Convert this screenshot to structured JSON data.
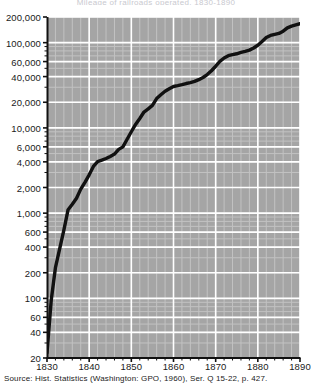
{
  "figure": {
    "title_cropped": "Mileage of railroads operated, 1830-1890",
    "source_note": "Source: Hist. Statistics (Washington: GPO, 1960), Ser. Q 15-22, p. 427.",
    "colors": {
      "plot_background": "#a5a5a5",
      "gridline": "#ffffff",
      "minor_gridline": "#c2c2c2",
      "curve": "#111111",
      "axis": "#111111",
      "page_background": "#ffffff",
      "text": "#1a1a1a"
    }
  },
  "chart_data": {
    "type": "line",
    "title": "Mileage of railroads operated, 1830-1890",
    "xlabel": "",
    "ylabel": "",
    "yscale": "log",
    "xscale": "linear",
    "grid": true,
    "legend": null,
    "xlim": [
      1830,
      1890
    ],
    "ylim": [
      20,
      200000
    ],
    "xticks": [
      1830,
      1840,
      1850,
      1860,
      1870,
      1880,
      1890
    ],
    "xticklabels": [
      "1830",
      "1840",
      "1850",
      "1860",
      "1870",
      "1880",
      "1890"
    ],
    "yticks": [
      20,
      40,
      60,
      100,
      200,
      400,
      600,
      1000,
      2000,
      4000,
      6000,
      10000,
      20000,
      40000,
      60000,
      100000,
      200000
    ],
    "yticklabels": [
      "20",
      "40",
      "60",
      "100",
      "200",
      "400",
      "600",
      "1,000",
      "2,000",
      "4,000",
      "6,000",
      "10,000",
      "20,000",
      "40,000",
      "60,000",
      "100,000",
      "200,000"
    ],
    "series": [
      {
        "name": "Railroad mileage operated",
        "x": [
          1830,
          1831,
          1832,
          1833,
          1834,
          1835,
          1836,
          1837,
          1838,
          1839,
          1840,
          1841,
          1842,
          1843,
          1844,
          1845,
          1846,
          1847,
          1848,
          1849,
          1850,
          1851,
          1852,
          1853,
          1854,
          1855,
          1856,
          1857,
          1858,
          1859,
          1860,
          1861,
          1862,
          1863,
          1864,
          1865,
          1866,
          1867,
          1868,
          1869,
          1870,
          1871,
          1872,
          1873,
          1874,
          1875,
          1876,
          1877,
          1878,
          1879,
          1880,
          1881,
          1882,
          1883,
          1884,
          1885,
          1886,
          1887,
          1888,
          1889,
          1890
        ],
        "y": [
          23,
          95,
          229,
          380,
          633,
          1098,
          1273,
          1497,
          1913,
          2302,
          2818,
          3535,
          4026,
          4185,
          4377,
          4633,
          4930,
          5598,
          5996,
          7365,
          9021,
          10982,
          12908,
          15360,
          16720,
          18374,
          22076,
          24503,
          26968,
          28789,
          30626,
          31286,
          32120,
          33170,
          33908,
          35085,
          36801,
          39050,
          42229,
          46844,
          52922,
          60301,
          66171,
          70268,
          72385,
          74096,
          76808,
          79082,
          81747,
          86556,
          93262,
          103145,
          114677,
          121422,
          125345,
          128320,
          136338,
          149214,
          156114,
          161276,
          166703
        ]
      }
    ],
    "annotations": []
  },
  "axes": {
    "y_labels": [
      {
        "text": "200,000",
        "value": 200000
      },
      {
        "text": "100,000",
        "value": 100000
      },
      {
        "text": "60,000",
        "value": 60000
      },
      {
        "text": "40,000",
        "value": 40000
      },
      {
        "text": "20,000",
        "value": 20000
      },
      {
        "text": "10,000",
        "value": 10000
      },
      {
        "text": "6,000",
        "value": 6000
      },
      {
        "text": "4,000",
        "value": 4000
      },
      {
        "text": "2,000",
        "value": 2000
      },
      {
        "text": "1,000",
        "value": 1000
      },
      {
        "text": "600",
        "value": 600
      },
      {
        "text": "400",
        "value": 400
      },
      {
        "text": "200",
        "value": 200
      },
      {
        "text": "100",
        "value": 100
      },
      {
        "text": "60",
        "value": 60
      },
      {
        "text": "40",
        "value": 40
      },
      {
        "text": "20",
        "value": 20
      }
    ],
    "x_labels": [
      {
        "text": "1830",
        "value": 1830
      },
      {
        "text": "1840",
        "value": 1840
      },
      {
        "text": "1850",
        "value": 1850
      },
      {
        "text": "1860",
        "value": 1860
      },
      {
        "text": "1870",
        "value": 1870
      },
      {
        "text": "1880",
        "value": 1880
      },
      {
        "text": "1890",
        "value": 1890
      }
    ]
  }
}
